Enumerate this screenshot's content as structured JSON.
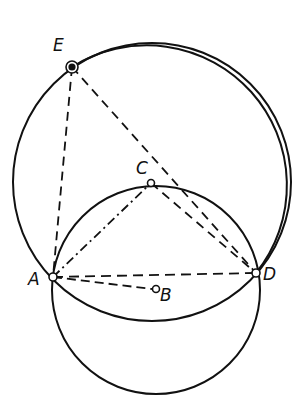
{
  "diagram": {
    "type": "geometric-construction",
    "stroke_color": "#111111",
    "background": "#ffffff",
    "points": [
      {
        "id": "E",
        "label": "E",
        "x": 72,
        "y": 67,
        "marker": "filled-ring"
      },
      {
        "id": "C",
        "label": "C",
        "x": 151,
        "y": 183,
        "marker": "open"
      },
      {
        "id": "A",
        "label": "A",
        "x": 53,
        "y": 277,
        "marker": "open"
      },
      {
        "id": "D",
        "label": "D",
        "x": 256,
        "y": 273,
        "marker": "open"
      },
      {
        "id": "B",
        "label": "B",
        "x": 156,
        "y": 289,
        "marker": "open"
      }
    ],
    "circles": [
      {
        "name": "large-circle",
        "cx": 152,
        "cy": 182,
        "r": 139,
        "style": "solid"
      },
      {
        "name": "small-circle-center-B",
        "cx": 156,
        "cy": 290,
        "r": 104,
        "style": "solid"
      }
    ],
    "arcs": [
      {
        "name": "arc-E-D-center-C",
        "from": "E",
        "to": "D",
        "center": "C",
        "style": "solid"
      }
    ],
    "segments": [
      {
        "from": "E",
        "to": "A",
        "style": "dashed"
      },
      {
        "from": "E",
        "to": "D",
        "style": "dashed"
      },
      {
        "from": "A",
        "to": "D",
        "style": "dashed"
      },
      {
        "from": "A",
        "to": "C",
        "style": "dash-dot"
      },
      {
        "from": "C",
        "to": "D",
        "style": "dashed"
      },
      {
        "from": "A",
        "to": "B",
        "style": "dashed"
      }
    ],
    "labels": {
      "E": "E",
      "C": "C",
      "A": "A",
      "D": "D",
      "B": "B"
    }
  }
}
